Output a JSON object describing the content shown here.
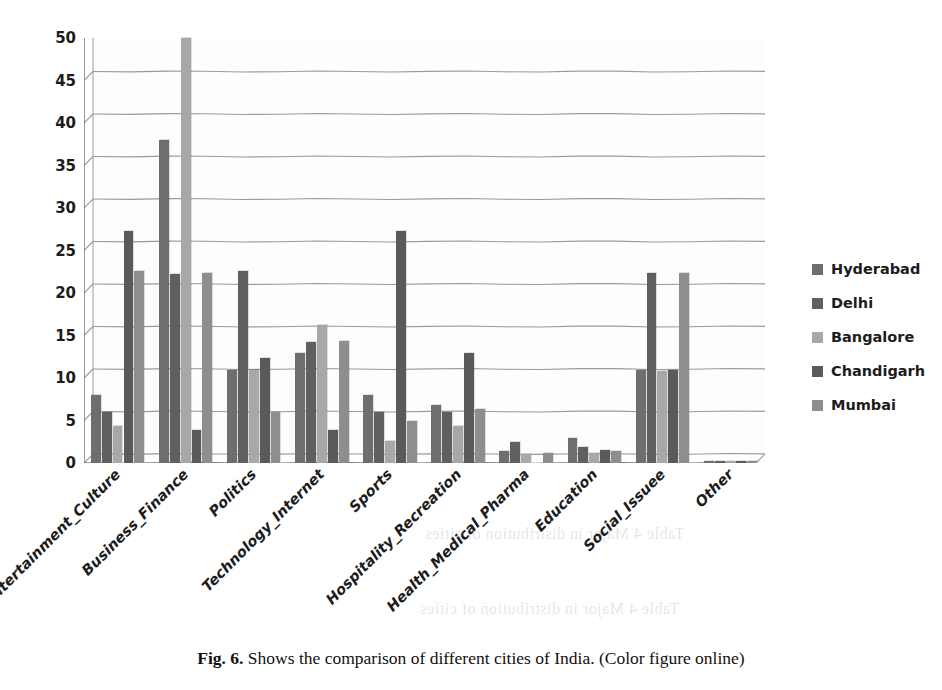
{
  "figure": {
    "caption_label": "Fig. 6.",
    "caption_text": "Shows the comparison of different cities of India. (Color figure online)"
  },
  "ghost_text": {
    "line1": "Hyderabad",
    "line2": "Table 4 Major in distribution of cities",
    "line3": "Table 4 Major in distribution of cities"
  },
  "legend": {
    "position": "right",
    "entries": [
      {
        "label": "Hyderabad",
        "color": "#6e6e6e"
      },
      {
        "label": "Delhi",
        "color": "#606060"
      },
      {
        "label": "Bangalore",
        "color": "#a8a8a8"
      },
      {
        "label": "Chandigarh",
        "color": "#5a5a5a"
      },
      {
        "label": "Mumbai",
        "color": "#8e8e8e"
      }
    ]
  },
  "chart_data": {
    "type": "bar",
    "title": "",
    "xlabel": "",
    "ylabel": "",
    "ylim": [
      0,
      50
    ],
    "y_ticks": [
      0,
      5,
      10,
      15,
      20,
      25,
      30,
      35,
      40,
      45,
      50
    ],
    "grid": true,
    "grid_axis": "y",
    "categories": [
      "Entertainment_Culture",
      "Business_Finance",
      "Politics",
      "Technology_Internet",
      "Sports",
      "Hospitality_Recreation",
      "Health_Medical_Pharma",
      "Education",
      "Social_Issuee",
      "Other"
    ],
    "series": [
      {
        "name": "Hyderabad",
        "color": "#6e6e6e",
        "values": [
          8.0,
          38.0,
          11.0,
          12.9,
          8.0,
          6.8,
          1.4,
          2.9,
          11.0,
          0.2
        ]
      },
      {
        "name": "Delhi",
        "color": "#606060",
        "values": [
          6.0,
          22.2,
          22.6,
          14.2,
          6.0,
          6.0,
          2.5,
          1.9,
          22.3,
          0.2
        ]
      },
      {
        "name": "Bangalore",
        "color": "#a8a8a8",
        "values": [
          4.3,
          50.0,
          11.0,
          16.2,
          2.6,
          4.3,
          1.1,
          1.2,
          10.8,
          0.2
        ]
      },
      {
        "name": "Chandigarh",
        "color": "#5a5a5a",
        "values": [
          27.3,
          3.9,
          12.3,
          3.9,
          27.3,
          12.9,
          0.0,
          1.5,
          11.0,
          0.2
        ]
      },
      {
        "name": "Mumbai",
        "color": "#8e8e8e",
        "values": [
          22.6,
          22.3,
          6.0,
          14.3,
          5.0,
          6.4,
          1.2,
          1.4,
          22.4,
          0.2
        ]
      }
    ]
  }
}
